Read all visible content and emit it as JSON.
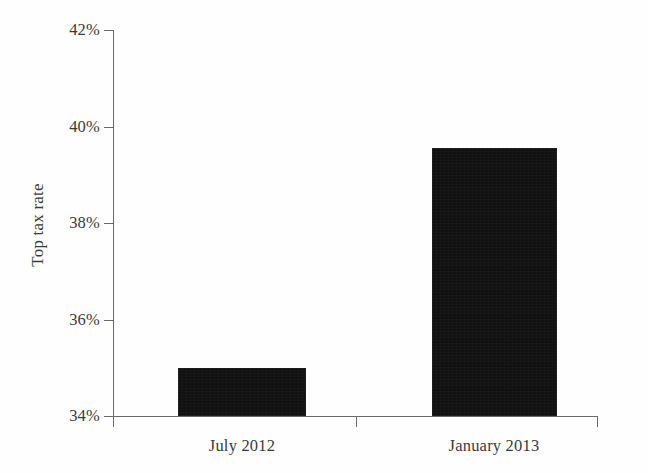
{
  "chart_data": {
    "type": "bar",
    "title": "",
    "xlabel": "",
    "ylabel": "Top tax rate",
    "categories": [
      "July 2012",
      "January 2013"
    ],
    "values": [
      35.0,
      39.55
    ],
    "value_labels": [
      "35%",
      "39.6%"
    ],
    "ylim": [
      34,
      42
    ],
    "yticks": [
      34,
      36,
      38,
      40,
      42
    ],
    "ytick_labels": [
      "34%",
      "36%",
      "38%",
      "40%",
      "42%"
    ],
    "grid": false,
    "legend": false,
    "legend_position": "none",
    "series": [
      {
        "name": "Top tax rate",
        "values": [
          35.0,
          39.55
        ]
      }
    ]
  },
  "style": {
    "bar_color": "#111111",
    "axis_color": "#6a6a6a",
    "text_color": "#3a3a3a",
    "background_color": "#fefefe"
  }
}
